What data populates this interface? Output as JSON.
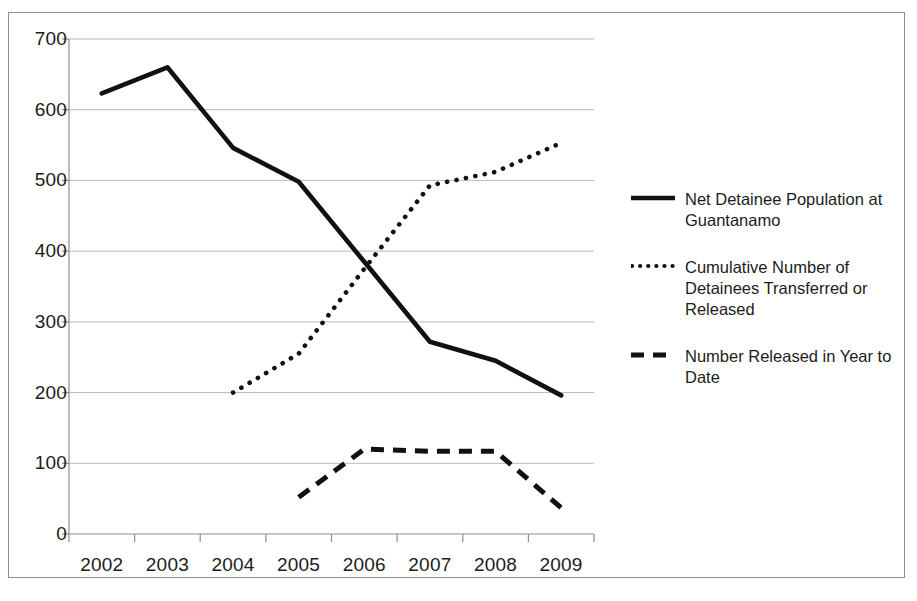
{
  "chart_data": {
    "type": "line",
    "title": "",
    "subtitle": "",
    "xlabel": "",
    "ylabel": "",
    "categories": [
      "2002",
      "2003",
      "2004",
      "2005",
      "2006",
      "2007",
      "2008",
      "2009"
    ],
    "x": [
      2002,
      2003,
      2004,
      2005,
      2006,
      2007,
      2008,
      2009
    ],
    "ylim": [
      0,
      700
    ],
    "ytick_step": 100,
    "yticks": [
      "0",
      "100",
      "200",
      "300",
      "400",
      "500",
      "600",
      "700"
    ],
    "grid": "horizontal",
    "legend_position": "right",
    "series": [
      {
        "name": "Net Detainee Population at Guantanamo",
        "style": "solid",
        "color": "#111111",
        "values": [
          623,
          660,
          546,
          498,
          385,
          272,
          245,
          196
        ]
      },
      {
        "name": "Cumulative Number of Detainees Transferred or Released",
        "style": "dotted",
        "color": "#111111",
        "values": [
          null,
          null,
          200,
          255,
          375,
          493,
          512,
          553
        ]
      },
      {
        "name": "Number Released in Year to Date",
        "style": "dashed",
        "color": "#111111",
        "values": [
          null,
          null,
          null,
          52,
          120,
          117,
          117,
          37
        ]
      }
    ]
  },
  "axes": {
    "y_tick_labels": [
      "700",
      "600",
      "500",
      "400",
      "300",
      "200",
      "100",
      "0"
    ],
    "x_tick_labels": [
      "2002",
      "2003",
      "2004",
      "2005",
      "2006",
      "2007",
      "2008",
      "2009"
    ]
  },
  "legend": {
    "entries": [
      {
        "label": "Net Detainee Population at Guantanamo",
        "style": "solid"
      },
      {
        "label": "Cumulative Number of Detainees Transferred or Released",
        "style": "dotted"
      },
      {
        "label": "Number Released in Year to Date",
        "style": "dashed"
      }
    ]
  },
  "colors": {
    "ink": "#111111",
    "gridline": "#b9b9b9",
    "axis": "#8e8e8e",
    "frame": "#8e8e8e",
    "background": "#ffffff"
  }
}
